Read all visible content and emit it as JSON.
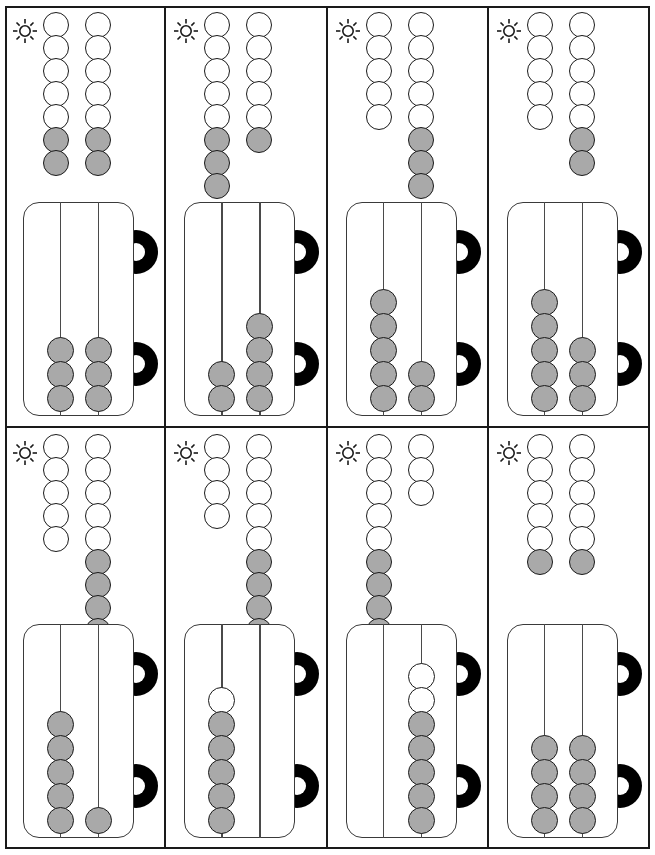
{
  "worksheet": {
    "icon": "sun-icon",
    "grid": {
      "columns": 4,
      "rows": 2,
      "cell_count": 8
    },
    "bead_colors": {
      "filled": "#a9a9a9",
      "empty": "#ffffff",
      "outline": "#1a1a1a"
    },
    "abacus_ear_color": "#000000",
    "problems": [
      {
        "id": 1,
        "row": 0,
        "column": 0,
        "bead_columns": [
          {
            "white": 5,
            "gray": 2,
            "total": 7
          },
          {
            "white": 5,
            "gray": 2,
            "total": 7
          }
        ],
        "abacus_rods": [
          {
            "white": 0,
            "gray": 3,
            "total": 3
          },
          {
            "white": 0,
            "gray": 3,
            "total": 3
          }
        ]
      },
      {
        "id": 2,
        "row": 0,
        "column": 1,
        "bead_columns": [
          {
            "white": 5,
            "gray": 3,
            "total": 8
          },
          {
            "white": 5,
            "gray": 1,
            "total": 6
          }
        ],
        "abacus_rods": [
          {
            "white": 0,
            "gray": 2,
            "total": 2
          },
          {
            "white": 0,
            "gray": 4,
            "total": 4
          }
        ]
      },
      {
        "id": 3,
        "row": 0,
        "column": 2,
        "bead_columns": [
          {
            "white": 5,
            "gray": 0,
            "total": 5
          },
          {
            "white": 5,
            "gray": 3,
            "total": 8
          }
        ],
        "abacus_rods": [
          {
            "white": 0,
            "gray": 5,
            "total": 5
          },
          {
            "white": 0,
            "gray": 2,
            "total": 2
          }
        ]
      },
      {
        "id": 4,
        "row": 0,
        "column": 3,
        "bead_columns": [
          {
            "white": 5,
            "gray": 0,
            "total": 5
          },
          {
            "white": 5,
            "gray": 2,
            "total": 7
          }
        ],
        "abacus_rods": [
          {
            "white": 0,
            "gray": 5,
            "total": 5
          },
          {
            "white": 0,
            "gray": 3,
            "total": 3
          }
        ]
      },
      {
        "id": 5,
        "row": 1,
        "column": 0,
        "bead_columns": [
          {
            "white": 5,
            "gray": 0,
            "total": 5
          },
          {
            "white": 5,
            "gray": 4,
            "total": 9
          }
        ],
        "abacus_rods": [
          {
            "white": 0,
            "gray": 5,
            "total": 5
          },
          {
            "white": 0,
            "gray": 1,
            "total": 1
          }
        ]
      },
      {
        "id": 6,
        "row": 1,
        "column": 1,
        "bead_columns": [
          {
            "white": 4,
            "gray": 0,
            "total": 4
          },
          {
            "white": 5,
            "gray": 5,
            "total": 10
          }
        ],
        "abacus_rods": [
          {
            "white": 1,
            "gray": 5,
            "total": 6
          },
          {
            "white": 0,
            "gray": 0,
            "total": 0
          }
        ]
      },
      {
        "id": 7,
        "row": 1,
        "column": 2,
        "bead_columns": [
          {
            "white": 5,
            "gray": 5,
            "total": 10
          },
          {
            "white": 3,
            "gray": 0,
            "total": 3
          }
        ],
        "abacus_rods": [
          {
            "white": 0,
            "gray": 0,
            "total": 0
          },
          {
            "white": 2,
            "gray": 5,
            "total": 7
          }
        ]
      },
      {
        "id": 8,
        "row": 1,
        "column": 3,
        "bead_columns": [
          {
            "white": 5,
            "gray": 1,
            "total": 6
          },
          {
            "white": 5,
            "gray": 1,
            "total": 6
          }
        ],
        "abacus_rods": [
          {
            "white": 0,
            "gray": 4,
            "total": 4
          },
          {
            "white": 0,
            "gray": 4,
            "total": 4
          }
        ]
      }
    ]
  }
}
